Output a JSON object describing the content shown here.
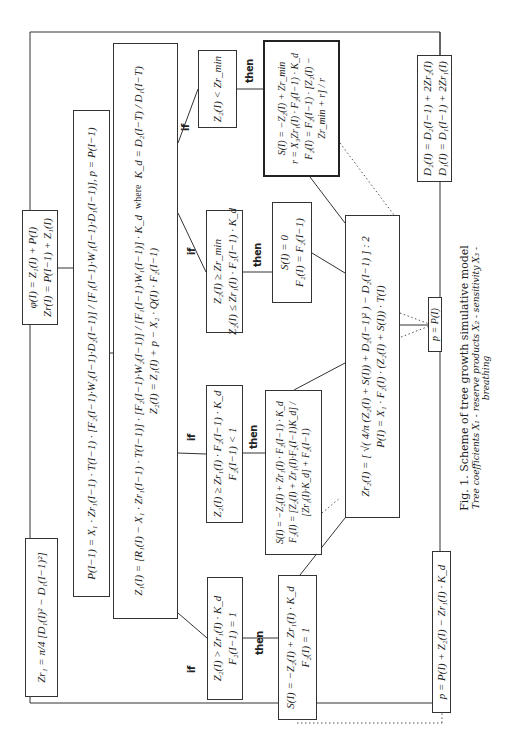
{
  "header_fragment": "A NEW MATHEMATICAL...",
  "keywords": {
    "if": "if",
    "then": "then",
    "where": "where"
  },
  "boxes": {
    "zr1": "Zr₁ = π/4 [D₁(I)² − D₁(I−1)²]",
    "phi": [
      "φ(I) = Z₁(I) + P(I)",
      "Zr(I) = P(I−1) + Z₁(I)"
    ],
    "p_prev": "P(I−1) = X₁ · Zr₁(I−1) · T(I−1) · [F₂(I−1)·W₂(I−1)·D₂(I−1)] / [F₁(I−1)·W₁(I−1)·D₁(I−1)],  p = P(I−1)",
    "z1": "Z₁(I) = [R₁(I) − X₁ · Zr₁(I−1) · T(I−1)] · [F₂(I−1)·W₂(I−1)] / [F₁(I−1)·W₁(I−1)] · K_d",
    "kd": "K_d = D₂(I−T) / D₁(I−T)",
    "z2": "Z₂(I) = Z₁(I) + p − X₂ · Q(I) · F₂(I−1)",
    "cond1": [
      "Z₂(I) > Zr₁(I) · K_d",
      "F₂(I−1) = 1"
    ],
    "cond2": [
      "Z₂(I) ≥ Zr₁(I) · F₂(I−1) · K_d",
      "F₂(I−1) < 1"
    ],
    "cond3": [
      "Z₂(I) ≥ Zr_min",
      "Z₂(I) ≤ Zr₁(I) · F₂(I−1) · K_d"
    ],
    "cond4": [
      "Z₂(I) < Zr_min"
    ],
    "then1": [
      "S(I) = −Z₂(I) + Zr₁(I) · K_d",
      "F₂(I) = 1"
    ],
    "then2": [
      "S(I) = −Z₂(I) + Zr₁(I) · F₂(I−1) · K_d",
      "F₂(I) = [Z₂(I) + Zr₁(I)·F₂(I−1)K_d] / [Zr₁(I)·K_d] + F₂(I−1)"
    ],
    "then3": [
      "S(I) = 0",
      "F₂(I) = F₂(I−1)"
    ],
    "then4": [
      "S(I) = −Z₂(I) + Zr_min",
      "r = X₃Zr₁(I) · F₂(I−1) · K_d",
      "F₂(I) = F₂(I−1) · [Z₂(I) − Zr_min + r] / r"
    ],
    "zr2": [
      "Zr₂(I) = [ √( 4/π (Z₂(I) + S(I)) + D₂(I−1)² ) − D₂(I−1) ] : 2",
      "P(I) = X₁ · F₂(I) · (Z₂(I) + S(I)) · T(I)"
    ],
    "p_eq": "p = P(I)",
    "d_box": [
      "D₂(I) = D₂(I−1) + 2Zr₂(I)",
      "D₁(I) = D₁(I−1) + 2Zr₁(I)"
    ],
    "p_final": "p = P(I) + Z₂(I) − Zr₁(I) · K_d"
  },
  "caption": {
    "title": "Fig. 1.  Scheme of tree growth simulative model",
    "subtitle": "Tree coefficients X₁ - reserve products X₂ - sensitivity X₃ - breathing"
  }
}
